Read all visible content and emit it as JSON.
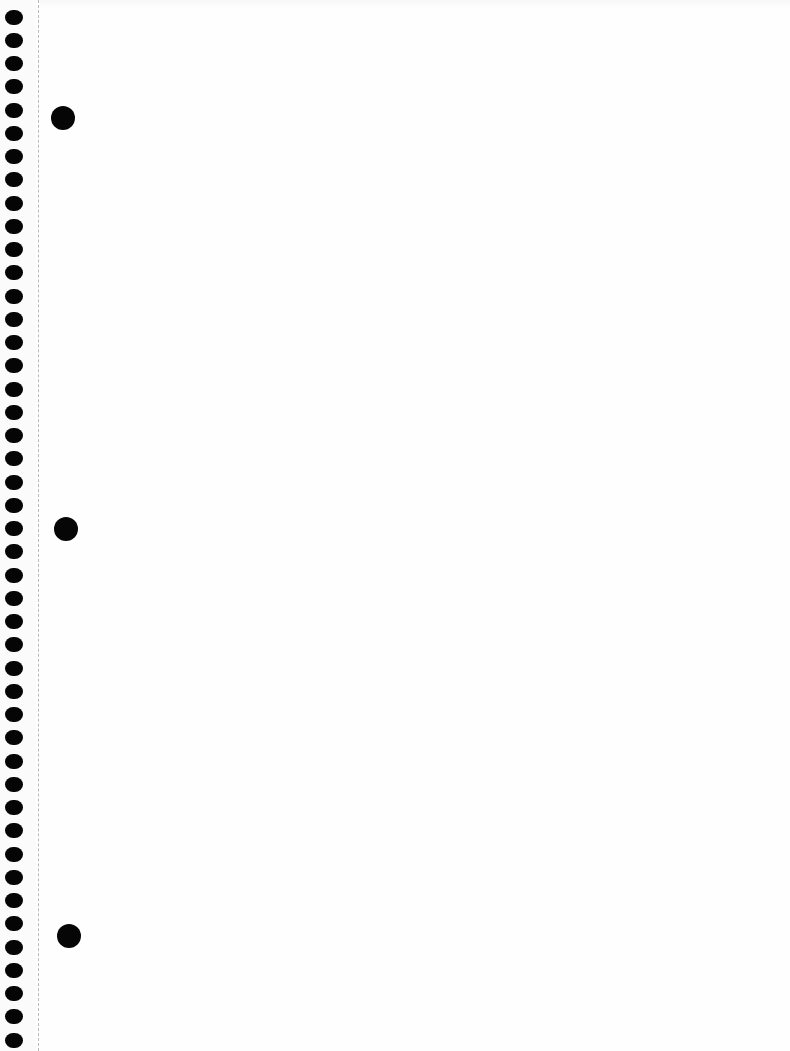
{
  "page": {
    "type": "spiral-notebook-paper",
    "background_color": "#fefefe",
    "ink_color": "#050505",
    "perforation_color": "#b9b9b9",
    "content_text": ""
  },
  "spiral_holes": {
    "count": 45,
    "center_x": 14,
    "first_center_y": 17,
    "spacing_y": 23.25,
    "width": 18,
    "height": 15
  },
  "perforation_line": {
    "x": 38,
    "style": "dashed"
  },
  "binder_holes": [
    {
      "cx": 63,
      "cy": 118,
      "diameter": 24
    },
    {
      "cx": 66,
      "cy": 529,
      "diameter": 24
    },
    {
      "cx": 69,
      "cy": 936,
      "diameter": 24
    }
  ]
}
